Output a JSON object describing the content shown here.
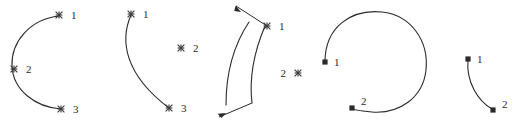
{
  "figure": {
    "title": "",
    "background_color": "#ffffff",
    "stroke_color": "#2b2b2b",
    "marker_color": "#3a3a3a",
    "width": 522,
    "height": 133,
    "shapes": [
      {
        "id": "shape-1",
        "kind": "open-arc-c-shape",
        "path": "M 59 16 C 30 19 11 42 12 66 C 13 90 35 107 61 109",
        "points": [
          {
            "label": "1",
            "marker": "x-marker",
            "x": 59,
            "y": 15,
            "label_x": 71,
            "label_y": 19
          },
          {
            "label": "2",
            "marker": "x-marker",
            "x": 14,
            "y": 69,
            "label_x": 26,
            "label_y": 73
          },
          {
            "label": "3",
            "marker": "x-marker",
            "x": 61,
            "y": 109,
            "label_x": 73,
            "label_y": 113
          }
        ],
        "arrows": []
      },
      {
        "id": "shape-2",
        "kind": "open-arc-with-detached-point",
        "path": "M 131 15 C 120 40 124 74 169 108",
        "points": [
          {
            "label": "1",
            "marker": "x-marker",
            "x": 131,
            "y": 14,
            "label_x": 143,
            "label_y": 18
          },
          {
            "label": "2",
            "marker": "x-marker",
            "x": 181,
            "y": 48,
            "label_x": 193,
            "label_y": 52
          },
          {
            "label": "3",
            "marker": "x-marker",
            "x": 169,
            "y": 108,
            "label_x": 181,
            "label_y": 112
          }
        ],
        "arrows": []
      },
      {
        "id": "shape-3",
        "kind": "ribbon-two-arcs-with-arrows",
        "path": "M 249 22 C 233 46 226 74 226 105",
        "path_2": "M 265 26 C 254 52 249 78 252 103",
        "points": [
          {
            "label": "1",
            "marker": "x-marker",
            "x": 267,
            "y": 26,
            "label_x": 279,
            "label_y": 30
          },
          {
            "label": "2",
            "marker": "x-marker",
            "x": 298,
            "y": 73,
            "label_x": 286,
            "label_y": 77
          }
        ],
        "arrows": [
          {
            "line": "M 267 26 L 236 6",
            "tip_x": 243,
            "tip_y": 11,
            "angle": 212
          },
          {
            "line": "M 252 103 L 219 117",
            "tip_x": 225,
            "tip_y": 114,
            "angle": 157
          }
        ]
      },
      {
        "id": "shape-4",
        "kind": "near-closed-circle",
        "path": "M 325 62 C 325 26 352 9 382 12 C 411 15 429 41 426 70 C 423 98 399 114 372 112 C 360 111 352 110 352 108",
        "points": [
          {
            "label": "1",
            "marker": "square-marker",
            "x": 325,
            "y": 62,
            "label_x": 334,
            "label_y": 66
          },
          {
            "label": "2",
            "marker": "square-marker",
            "x": 352,
            "y": 108,
            "label_x": 361,
            "label_y": 105
          }
        ],
        "arrows": []
      },
      {
        "id": "shape-5",
        "kind": "short-arc",
        "path": "M 468 60 C 466 82 478 101 492 109",
        "points": [
          {
            "label": "1",
            "marker": "square-marker",
            "x": 468,
            "y": 59,
            "label_x": 477,
            "label_y": 63
          },
          {
            "label": "2",
            "marker": "square-marker",
            "x": 493,
            "y": 110,
            "label_x": 502,
            "label_y": 108
          }
        ],
        "arrows": []
      }
    ]
  }
}
